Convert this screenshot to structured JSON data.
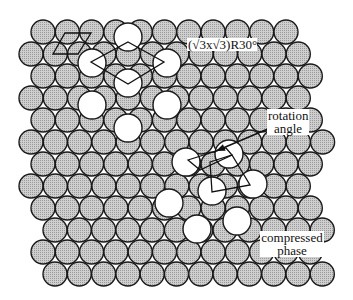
{
  "labels": {
    "superstructure": "(√3x√3)R30°",
    "rotation_line1": "rotation",
    "rotation_line2": "angle",
    "compressed_line1": "compressed",
    "compressed_line2": "phase"
  },
  "colors": {
    "substrate_fill": "#c4c4c4",
    "substrate_stroke": "#1a1a1a",
    "adsorbate_fill": "#ffffff",
    "line": "#111111"
  },
  "substrate": {
    "radius": 12,
    "spacing": 24.3,
    "rows": [
      {
        "y": 32,
        "x_start": 43,
        "count": 11
      },
      {
        "y": 54,
        "x_start": 31,
        "count": 12
      },
      {
        "y": 76,
        "x_start": 43,
        "count": 12
      },
      {
        "y": 98,
        "x_start": 31,
        "count": 12
      },
      {
        "y": 120,
        "x_start": 43,
        "count": 12
      },
      {
        "y": 142,
        "x_start": 31,
        "count": 13
      },
      {
        "y": 164,
        "x_start": 43,
        "count": 12
      },
      {
        "y": 186,
        "x_start": 31,
        "count": 12
      },
      {
        "y": 208,
        "x_start": 43,
        "count": 12
      },
      {
        "y": 230,
        "x_start": 55,
        "count": 12
      },
      {
        "y": 252,
        "x_start": 43,
        "count": 12
      },
      {
        "y": 274,
        "x_start": 55,
        "count": 12
      }
    ]
  },
  "adsorbates_commensurate": {
    "radius": 14,
    "points": [
      [
        128,
        37
      ],
      [
        92,
        63
      ],
      [
        167,
        63
      ],
      [
        128,
        83
      ],
      [
        92,
        105
      ],
      [
        167,
        105
      ],
      [
        128,
        128
      ]
    ]
  },
  "adsorbates_compressed": {
    "radius": 14,
    "points": [
      [
        186,
        162
      ],
      [
        229,
        154
      ],
      [
        212,
        191
      ],
      [
        253,
        184
      ],
      [
        169,
        203
      ],
      [
        197,
        229
      ],
      [
        237,
        221
      ]
    ]
  },
  "unit_cells": {
    "substrate_cell": [
      [
        65,
        33
      ],
      [
        91,
        33
      ],
      [
        78,
        54
      ],
      [
        53,
        54
      ]
    ],
    "sqrt3_cell": [
      [
        128,
        42
      ],
      [
        164,
        62
      ],
      [
        128,
        84
      ],
      [
        91,
        62
      ]
    ],
    "rotated_cell_a": [
      [
        188,
        160
      ],
      [
        226,
        148
      ],
      [
        232,
        155
      ],
      [
        200,
        170
      ]
    ],
    "rotated_cell_b": [
      [
        210,
        162
      ],
      [
        232,
        155
      ],
      [
        250,
        185
      ],
      [
        212,
        192
      ]
    ]
  },
  "arrow": {
    "from": [
      270,
      128
    ],
    "to": [
      216,
      151
    ]
  }
}
